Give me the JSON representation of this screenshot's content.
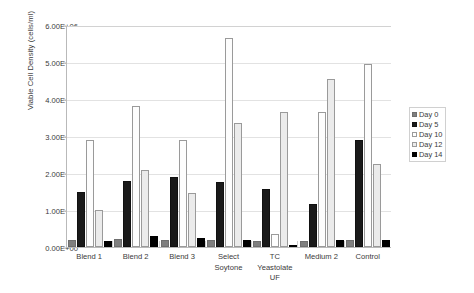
{
  "chart_data": {
    "type": "bar",
    "title": "",
    "xlabel": "",
    "ylabel": "Viable Cell Density (cells/ml)",
    "ylim": [
      0,
      6000000
    ],
    "ytick_labels": [
      "0.00E+00",
      "1.00E+06",
      "2.00E+06",
      "3.00E+06",
      "4.00E+06",
      "5.00E+06",
      "6.00E+06"
    ],
    "ytick_values": [
      0,
      1000000,
      2000000,
      3000000,
      4000000,
      5000000,
      6000000
    ],
    "grid": "horizontal",
    "legend_position": "right",
    "categories": [
      "Blend 1",
      "Blend 2",
      "Blend 3",
      "Select Soytone",
      "TC Yeastolate UF",
      "Medium 2",
      "Control"
    ],
    "series": [
      {
        "name": "Day 0",
        "color": "#7f7f7f",
        "values": [
          200000,
          220000,
          200000,
          180000,
          150000,
          170000,
          200000
        ]
      },
      {
        "name": "Day 5",
        "color": "#1a1a1a",
        "values": [
          1500000,
          1780000,
          1880000,
          1770000,
          1560000,
          1150000,
          2890000
        ]
      },
      {
        "name": "Day 10",
        "color": "#fdfdfd",
        "values": [
          2890000,
          3800000,
          2880000,
          5660000,
          350000,
          3650000,
          4950000
        ]
      },
      {
        "name": "Day 12",
        "color": "#ebebeb",
        "values": [
          1000000,
          2090000,
          1450000,
          3350000,
          3650000,
          4550000,
          2250000
        ]
      },
      {
        "name": "Day 14",
        "color": "#000000",
        "values": [
          160000,
          290000,
          240000,
          180000,
          60000,
          200000,
          180000
        ]
      }
    ]
  },
  "legend": {
    "items": [
      {
        "label": "Day 0"
      },
      {
        "label": "Day 5"
      },
      {
        "label": "Day 10"
      },
      {
        "label": "Day 12"
      },
      {
        "label": "Day 14"
      }
    ]
  }
}
